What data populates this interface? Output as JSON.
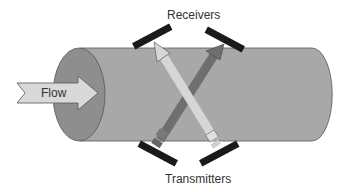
{
  "labels": {
    "receivers": "Receivers",
    "transmitters": "Transmitters",
    "flow": "Flow"
  },
  "colors": {
    "pipe_body": "#a8a8a8",
    "pipe_end": "#8e8e8e",
    "sensor": "#1a1a1a",
    "beam_light": "#d6d6d6",
    "beam_dark": "#6f6f6f",
    "flow_arrow": "#d9d9d9"
  }
}
